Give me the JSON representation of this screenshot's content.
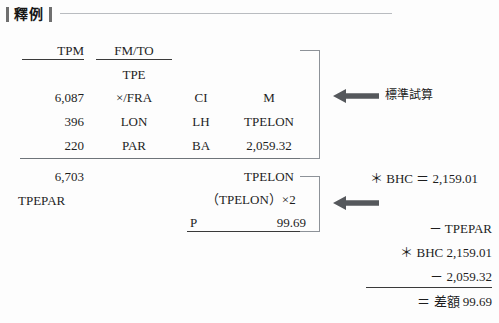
{
  "header": {
    "title": "釋例",
    "left_bar": "bar",
    "right_bar": "bar"
  },
  "table": {
    "columns": [
      "TPM",
      "FM/TO",
      "",
      ""
    ],
    "rows": [
      {
        "tpm": "",
        "fmto": "TPE",
        "carrier": "",
        "value": ""
      },
      {
        "tpm": "6,087",
        "fmto": "×/FRA",
        "carrier": "CI",
        "value": "M"
      },
      {
        "tpm": "396",
        "fmto": "LON",
        "carrier": "LH",
        "value": "TPELON"
      },
      {
        "tpm": "220",
        "fmto": "PAR",
        "carrier": "BA",
        "value": "2,059.32"
      }
    ],
    "totals": {
      "tpm_total": "6,703",
      "route_label": "TPEPAR",
      "fare_basis": "TPELON",
      "calc_line": "（TPELON）×2",
      "p_label": "P",
      "p_value": "99.69"
    }
  },
  "annotations": {
    "standard_calc": "標準試算",
    "bhc_equals": "＊ BHC ＝ 2,159.01"
  },
  "computation": {
    "minus_tpepar": "－ TPEPAR",
    "bhc_value": "＊ BHC 2,159.01",
    "minus_amount": "－ 2,059.32",
    "difference": "＝ 差額 99.69"
  },
  "icons": {
    "arrow_left_top": "arrow-left-icon",
    "arrow_left_bottom": "arrow-left-icon"
  }
}
